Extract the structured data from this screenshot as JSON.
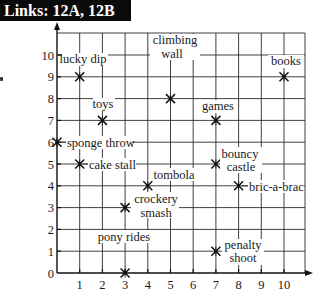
{
  "header": {
    "title": "Links: 12A, 12B"
  },
  "chart_data": {
    "type": "scatter",
    "title": "",
    "xlabel": "",
    "ylabel": "",
    "xlim": [
      0,
      10
    ],
    "ylim": [
      0,
      10
    ],
    "grid": true,
    "x_ticks": [
      1,
      2,
      3,
      4,
      5,
      6,
      7,
      8,
      9,
      10
    ],
    "y_ticks": [
      0,
      1,
      2,
      3,
      4,
      5,
      6,
      7,
      8,
      9,
      10
    ],
    "marker": "asterisk-x",
    "points": [
      {
        "name": "lucky dip",
        "x": 1,
        "y": 9
      },
      {
        "name": "climbing wall",
        "x": 5,
        "y": 8
      },
      {
        "name": "books",
        "x": 10,
        "y": 9
      },
      {
        "name": "toys",
        "x": 2,
        "y": 7
      },
      {
        "name": "games",
        "x": 7,
        "y": 7
      },
      {
        "name": "sponge throw",
        "x": 0,
        "y": 6
      },
      {
        "name": "cake stall",
        "x": 1,
        "y": 5
      },
      {
        "name": "bouncy castle",
        "x": 7,
        "y": 5
      },
      {
        "name": "tombola",
        "x": 4,
        "y": 4
      },
      {
        "name": "bric-a-brac",
        "x": 8,
        "y": 4
      },
      {
        "name": "crockery smash",
        "x": 3,
        "y": 3
      },
      {
        "name": "pony rides",
        "x": 3,
        "y": 0
      },
      {
        "name": "penalty shoot",
        "x": 7,
        "y": 1
      }
    ]
  },
  "labels": {
    "lucky_dip": "lucky dip",
    "climbing": "climbing",
    "wall": "wall",
    "books": "books",
    "toys": "toys",
    "games": "games",
    "sponge_throw": "sponge throw",
    "cake_stall": "cake stall",
    "bouncy": "bouncy",
    "castle": "castle",
    "tombola": "tombola",
    "bric_a_brac": "bric-a-brac",
    "crockery": "crockery",
    "smash": "smash",
    "pony_rides": "pony rides",
    "penalty": "penalty",
    "shoot": "shoot"
  }
}
